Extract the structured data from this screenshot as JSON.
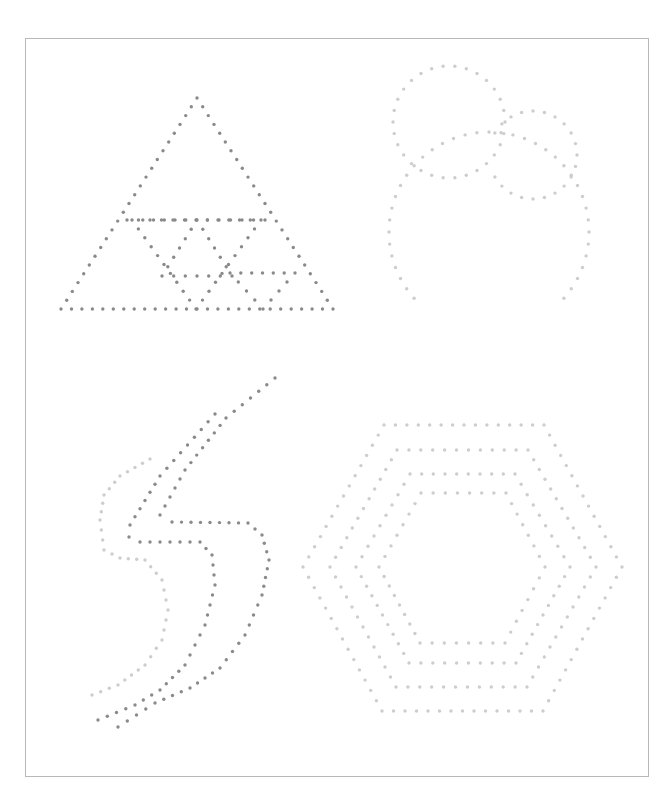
{
  "page": {
    "width": 672,
    "height": 801,
    "background": "#ffffff",
    "frame": {
      "x": 25,
      "y": 38,
      "w": 624,
      "h": 739,
      "border_color": "#b8b8b8"
    }
  },
  "colors": {
    "dark_dot": "#8a8a8a",
    "light_dot": "#cdcdcd"
  },
  "dot_radius": 1.7,
  "shapes": [
    {
      "name": "triangle-outer",
      "kind": "polyline",
      "color": "dark",
      "spacing": 10.5,
      "closed": true,
      "points": [
        [
          197,
          98
        ],
        [
          333,
          309
        ],
        [
          61,
          309
        ]
      ]
    },
    {
      "name": "triangle-mid-bar",
      "kind": "polyline",
      "color": "dark",
      "spacing": 11.5,
      "closed": false,
      "points": [
        [
          127,
          220
        ],
        [
          265,
          220
        ]
      ]
    },
    {
      "name": "triangle-inner-1",
      "kind": "polyline",
      "color": "dark",
      "spacing": 10.5,
      "closed": true,
      "points": [
        [
          132,
          220
        ],
        [
          261,
          220
        ],
        [
          196,
          309
        ]
      ]
    },
    {
      "name": "triangle-inner-2",
      "kind": "polyline",
      "color": "dark",
      "spacing": 11.5,
      "closed": true,
      "points": [
        [
          197,
          220
        ],
        [
          232,
          276
        ],
        [
          162,
          276
        ]
      ]
    },
    {
      "name": "triangle-inner-3",
      "kind": "polyline",
      "color": "dark",
      "spacing": 11.5,
      "closed": true,
      "points": [
        [
          230,
          273
        ],
        [
          295,
          273
        ],
        [
          263,
          309
        ]
      ]
    },
    {
      "name": "circle-small-left",
      "kind": "circle",
      "color": "light",
      "cx": 449,
      "cy": 122,
      "r": 56,
      "count": 30
    },
    {
      "name": "circle-small-right",
      "kind": "circle",
      "color": "light",
      "cx": 533,
      "cy": 155,
      "r": 44,
      "count": 24,
      "skip_range": [
        155,
        200
      ]
    },
    {
      "name": "circle-large",
      "kind": "circle",
      "color": "light",
      "cx": 489,
      "cy": 232,
      "r": 100,
      "count": 52,
      "skip_range": [
        225,
        318
      ]
    },
    {
      "name": "bolt-outer-left",
      "kind": "polyline",
      "color": "light",
      "spacing": 9.5,
      "closed": false,
      "points": [
        [
          150,
          459
        ],
        [
          120,
          476
        ],
        [
          104,
          495
        ],
        [
          100,
          520
        ],
        [
          104,
          550
        ],
        [
          120,
          558
        ],
        [
          145,
          560
        ],
        [
          162,
          580
        ],
        [
          168,
          610
        ],
        [
          162,
          640
        ],
        [
          145,
          665
        ],
        [
          118,
          685
        ],
        [
          92,
          695
        ]
      ]
    },
    {
      "name": "bolt-dark-left",
      "kind": "polyline",
      "color": "dark",
      "spacing": 10,
      "closed": false,
      "points": [
        [
          215,
          414
        ],
        [
          160,
          476
        ],
        [
          130,
          525
        ],
        [
          129,
          537
        ],
        [
          140,
          542
        ],
        [
          200,
          542
        ],
        [
          212,
          555
        ],
        [
          215,
          585
        ],
        [
          205,
          625
        ],
        [
          185,
          665
        ],
        [
          160,
          690
        ],
        [
          135,
          705
        ],
        [
          98,
          720
        ]
      ]
    },
    {
      "name": "bolt-dark-right",
      "kind": "polyline",
      "color": "dark",
      "spacing": 10,
      "closed": false,
      "points": [
        [
          275,
          378
        ],
        [
          226,
          418
        ],
        [
          185,
          470
        ],
        [
          160,
          515
        ],
        [
          172,
          522
        ],
        [
          248,
          523
        ],
        [
          262,
          535
        ],
        [
          269,
          560
        ],
        [
          262,
          595
        ],
        [
          245,
          635
        ],
        [
          220,
          668
        ],
        [
          190,
          688
        ],
        [
          155,
          703
        ],
        [
          118,
          727
        ]
      ]
    },
    {
      "name": "hex-outer",
      "kind": "polyline",
      "color": "light",
      "spacing": 11.5,
      "closed": true,
      "points": [
        [
          384,
          425
        ],
        [
          544,
          425
        ],
        [
          622,
          567
        ],
        [
          543,
          711
        ],
        [
          382,
          711
        ],
        [
          303,
          567
        ]
      ]
    },
    {
      "name": "hex-2",
      "kind": "polyline",
      "color": "light",
      "spacing": 11.5,
      "closed": true,
      "points": [
        [
          397,
          450
        ],
        [
          528,
          450
        ],
        [
          596,
          567
        ],
        [
          527,
          687
        ],
        [
          396,
          687
        ],
        [
          330,
          567
        ]
      ]
    },
    {
      "name": "hex-3",
      "kind": "polyline",
      "color": "light",
      "spacing": 11.5,
      "closed": true,
      "points": [
        [
          410,
          474
        ],
        [
          515,
          474
        ],
        [
          570,
          567
        ],
        [
          516,
          663
        ],
        [
          409,
          663
        ],
        [
          356,
          567
        ]
      ]
    },
    {
      "name": "hex-inner",
      "kind": "polyline",
      "color": "light",
      "spacing": 11.5,
      "closed": true,
      "points": [
        [
          421,
          493
        ],
        [
          506,
          493
        ],
        [
          545,
          567
        ],
        [
          505,
          643
        ],
        [
          420,
          643
        ],
        [
          379,
          567
        ]
      ]
    }
  ]
}
